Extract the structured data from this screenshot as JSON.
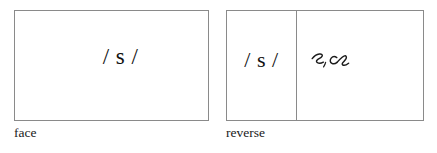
{
  "figure": {
    "background_color": "#ffffff",
    "border_color": "#8a8a8a",
    "text_color": "#111111"
  },
  "cards": [
    {
      "id": "face",
      "caption": "face",
      "cells": [
        {
          "id": "face-phoneme",
          "kind": "phonemic-transcription",
          "text": "/ s /"
        }
      ]
    },
    {
      "id": "reverse",
      "caption": "reverse",
      "cells": [
        {
          "id": "reverse-phoneme",
          "kind": "phonemic-transcription",
          "text": "/ s /"
        },
        {
          "id": "reverse-script",
          "kind": "handwritten-cursive",
          "text": "s, ce"
        }
      ]
    }
  ]
}
